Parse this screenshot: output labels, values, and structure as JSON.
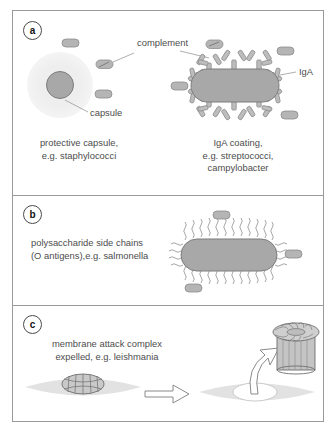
{
  "figure": {
    "panels": [
      {
        "id": "a",
        "label": "a",
        "captions": [
          "protective capsule,\ne.g. staphylococci",
          "IgA coating,\ne.g. streptococci,\ncampylobacter"
        ],
        "annotations": [
          {
            "name": "complement",
            "text": "complement"
          },
          {
            "name": "capsule",
            "text": "capsule"
          },
          {
            "name": "iga",
            "text": "IgA"
          }
        ]
      },
      {
        "id": "b",
        "label": "b",
        "captions": [
          "polysaccharide side chains\n(O antigens),e.g. salmonella"
        ],
        "annotations": []
      },
      {
        "id": "c",
        "label": "c",
        "captions": [
          "membrane attack complex\nexpelled, e.g. leishmania"
        ],
        "annotations": []
      }
    ]
  },
  "colors": {
    "border": "#9a9a9a",
    "text": "#4d4d4d",
    "cell_fill": "#a8a8a8",
    "cell_stroke": "#7d7d7d",
    "capsule_halo": "#efefef",
    "complement_fill": "#b5b5b5",
    "antibody_fill": "#bdbdbd",
    "membrane_fill": "#dcdcdc",
    "pore_fill": "#c4c4c4",
    "background": "#ffffff"
  },
  "icons": {
    "capsule_cell": "capsule-cell-icon",
    "complement_capsule": "complement-capsule-icon",
    "rod_bacterium": "rod-bacterium-icon",
    "iga_antibody": "iga-antibody-icon",
    "side_chain": "polysaccharide-side-chain-icon",
    "membrane": "membrane-icon",
    "mac_pore": "mac-pore-icon",
    "block_arrow": "block-arrow-icon",
    "curved_arrow": "curved-arrow-icon"
  }
}
